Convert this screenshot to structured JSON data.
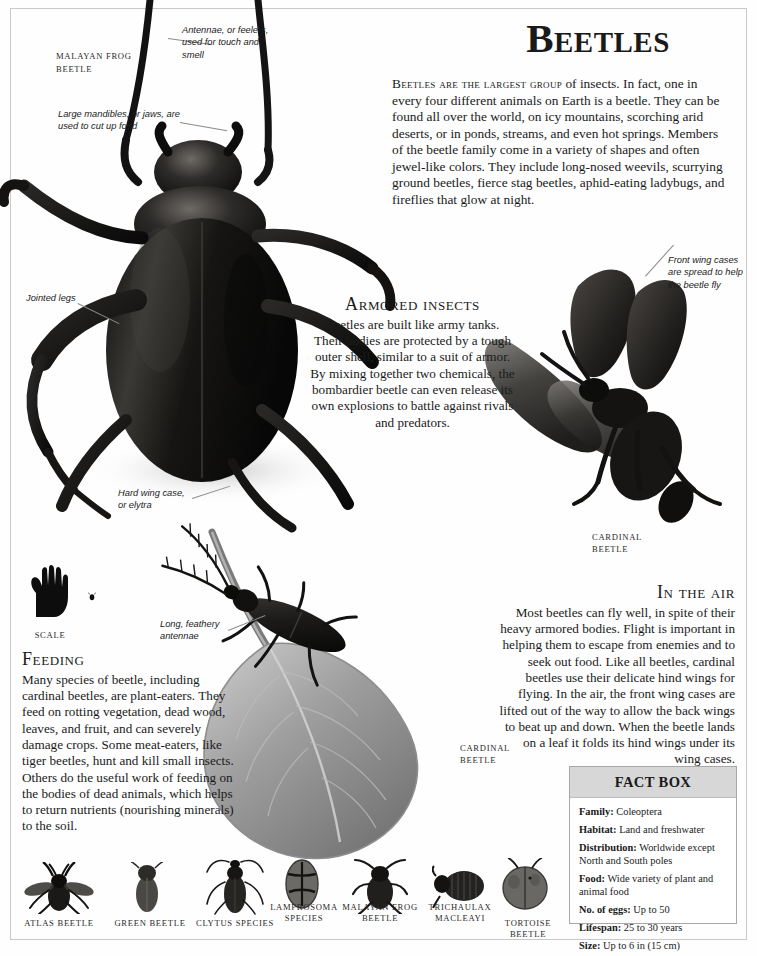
{
  "page": {
    "headline": "Beetles",
    "intro_lead": "Beetles are the largest group",
    "intro_rest": " of insects. In fact, one in every four different animals on Earth is a beetle. They can be found all over the world, on icy mountains, scorching arid deserts, or in ponds, streams, and even hot springs. Members of the beetle family come in a variety of shapes and often jewel-like colors. They include long-nosed weevils, scurrying ground beetles, fierce stag beetles, aphid-eating ladybugs, and fireflies that glow at night."
  },
  "sections": [
    {
      "id": "armored",
      "heading": "Armored insects",
      "body": "Beetles are built like army tanks. Their bodies are protected by a tough outer shell, similar to a suit of armor. By mixing together two chemicals, the bombardier beetle can even release its own explosions to battle against rivals and predators."
    },
    {
      "id": "in-the-air",
      "heading": "In the air",
      "body": "Most beetles can fly well, in spite of their heavy armored bodies. Flight is important in helping them to escape from enemies and to seek out food. Like all beetles, cardinal beetles use their delicate hind wings for flying. In the air, the front wing cases are lifted out of the way to allow the back wings to beat up and down. When the beetle lands on a leaf it folds its hind wings under its wing cases."
    },
    {
      "id": "feeding",
      "heading": "Feeding",
      "body": "Many species of beetle, including cardinal beetles, are plant-eaters. They feed on rotting vegetation, dead wood, leaves, and fruit, and can severely damage crops. Some meat-eaters, like tiger beetles, hunt and kill small insects. Others do the useful work of feeding on the bodies of dead animals, which helps to return nutrients (nourishing minerals) to the soil."
    }
  ],
  "callouts": [
    {
      "id": "antennae",
      "text": "Antennae, or feelers, used for touch and smell"
    },
    {
      "id": "mandibles",
      "text": "Large mandibles, or jaws, are used to cut up food"
    },
    {
      "id": "jointed-legs",
      "text": "Jointed legs"
    },
    {
      "id": "hard-wing-case",
      "text": "Hard wing case, or elytra"
    },
    {
      "id": "front-wing-cases",
      "text": "Front wing cases are spread to help the beetle fly"
    },
    {
      "id": "long-feathery-antennae",
      "text": "Long, feathery antennae"
    }
  ],
  "specimen_labels": [
    {
      "id": "malayan-frog-beetle-main",
      "text": "MALAYAN FROG BEETLE"
    },
    {
      "id": "cardinal-beetle-flying",
      "text": "CARDINAL BEETLE"
    },
    {
      "id": "cardinal-beetle-leaf",
      "text": "CARDINAL BEETLE"
    }
  ],
  "scale": {
    "caption": "SCALE"
  },
  "fact_box": {
    "title": "FACT BOX",
    "rows": [
      {
        "label": "Family:",
        "value": "Coleoptera"
      },
      {
        "label": "Habitat:",
        "value": "Land and freshwater"
      },
      {
        "label": "Distribution:",
        "value": "Worldwide except North and South poles"
      },
      {
        "label": "Food:",
        "value": "Wide variety of plant and animal food"
      },
      {
        "label": "No. of eggs:",
        "value": "Up to 50"
      },
      {
        "label": "Lifespan:",
        "value": "25 to 30 years"
      },
      {
        "label": "Size:",
        "value": "Up to 6 in (15 cm)"
      }
    ]
  },
  "specimen_strip": [
    {
      "id": "atlas-beetle",
      "label": "ATLAS BEETLE"
    },
    {
      "id": "green-beetle",
      "label": "GREEN BEETLE"
    },
    {
      "id": "clytus-species",
      "label": "CLYTUS SPECIES"
    },
    {
      "id": "lamprosoma-species",
      "label": "LAMPROSOMA SPECIES"
    },
    {
      "id": "malayan-frog-beetle",
      "label": "MALAYAN FROG BEETLE"
    },
    {
      "id": "trichaulax-macleayi",
      "label": "TRICHAULAX MACLEAYI"
    },
    {
      "id": "tortoise-beetle",
      "label": "TORTOISE BEETLE"
    }
  ],
  "colors": {
    "page_background": "#fefefe",
    "frame_border": "#c9c9c9",
    "text": "#1a1a1a",
    "factbox_header_bg": "#d7d7d7",
    "factbox_border": "#a8a8a8",
    "leader_line": "#8a8a8a"
  }
}
